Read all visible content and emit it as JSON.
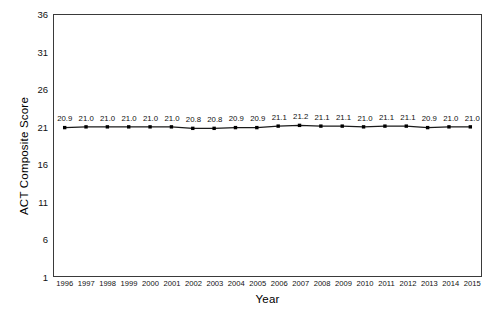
{
  "chart_data": {
    "type": "line",
    "title": "",
    "xlabel": "Year",
    "ylabel": "ACT Composite Score",
    "categories": [
      "1996",
      "1997",
      "1998",
      "1999",
      "2000",
      "2001",
      "2002",
      "2003",
      "2004",
      "2005",
      "2006",
      "2007",
      "2008",
      "2009",
      "2010",
      "2011",
      "2012",
      "2013",
      "2014",
      "2015"
    ],
    "values": [
      20.9,
      21.0,
      21.0,
      21.0,
      21.0,
      21.0,
      20.8,
      20.8,
      20.9,
      20.9,
      21.1,
      21.2,
      21.1,
      21.1,
      21.0,
      21.1,
      21.1,
      20.9,
      21.0,
      21.0
    ],
    "data_labels": [
      "20.9",
      "21.0",
      "21.0",
      "21.0",
      "21.0",
      "21.0",
      "20.8",
      "20.8",
      "20.9",
      "20.9",
      "21.1",
      "21.2",
      "21.1",
      "21.1",
      "21.0",
      "21.1",
      "21.1",
      "20.9",
      "21.0",
      "21.0"
    ],
    "yticks": [
      1,
      6,
      11,
      16,
      21,
      26,
      31,
      36
    ],
    "ytick_labels": [
      "1",
      "6",
      "11",
      "16",
      "21",
      "26",
      "31",
      "36"
    ],
    "ylim": [
      1,
      36
    ],
    "grid": false,
    "legend": false,
    "legend_position": "none",
    "series_color": "#1a1a1a",
    "marker": "square",
    "marker_color": "#000000",
    "frame_color": "#3a3a3a",
    "background_color": "#ffffff"
  }
}
